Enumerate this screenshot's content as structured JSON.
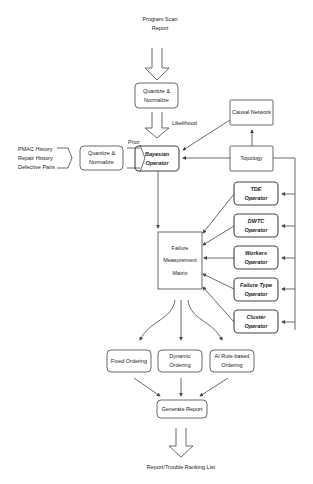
{
  "diagram": {
    "input_top": "Program Scan\nReport",
    "quantize_top": "Quantize &\nNormalize",
    "likelihood_label": "Likelihood",
    "left_inputs": [
      "PMAC History",
      "Repair History",
      "Defective Pairs"
    ],
    "quantize_left": "Quantize &\nNormalize",
    "prior_label": "Prior",
    "bayesian": "Bayesian\nOperator",
    "causal_network": "Causal Network",
    "topology": "Topology",
    "operators": [
      {
        "label": "TDE\nOperator"
      },
      {
        "label": "DWTC\nOperator"
      },
      {
        "label": "Workers\nOperator"
      },
      {
        "label": "Failure Type\nOperator"
      },
      {
        "label": "Cluster\nOperator"
      }
    ],
    "matrix": "Failure\nMeasurement\nMatrix",
    "orderings": [
      {
        "label": "Fixed Ordering"
      },
      {
        "label": "Dynamic\nOrdering"
      },
      {
        "label": "AI Rule-based\nOrdering"
      }
    ],
    "generate_report": "Generate Report",
    "output": "Report/Trouble Ranking List"
  }
}
